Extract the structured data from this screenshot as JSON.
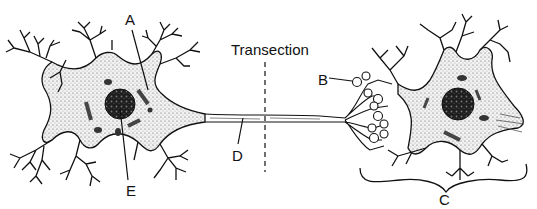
{
  "diagram": {
    "type": "neuron-schematic",
    "labels": {
      "A": "A",
      "B": "B",
      "C": "C",
      "D": "D",
      "E": "E",
      "transection": "Transection"
    },
    "components": [
      {
        "name": "presynaptic-neuron",
        "position": "left"
      },
      {
        "name": "axon",
        "position": "center"
      },
      {
        "name": "transection-line",
        "position": "center",
        "style": "dashed"
      },
      {
        "name": "axon-terminals",
        "position": "right-left"
      },
      {
        "name": "postsynaptic-neuron",
        "position": "right"
      }
    ],
    "colors": {
      "ink": "#111111",
      "cytoplasm_stipple": "#e6e6e6",
      "nucleus": "#2a2a2a",
      "background": "#ffffff"
    }
  }
}
